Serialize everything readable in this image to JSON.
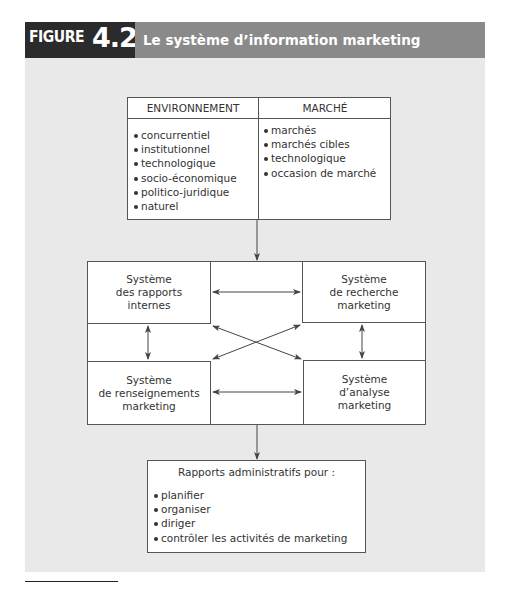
{
  "figure": {
    "label_word": "FIGURE",
    "label_number": "4.2",
    "title": "Le système d’information marketing",
    "colors": {
      "label_bg": "#2b2b2b",
      "title_bg": "#8a8a8a",
      "panel_bg": "#e9e9e9",
      "box_border": "#555555"
    }
  },
  "inputs_table": {
    "columns": [
      {
        "header": "ENVIRONNEMENT",
        "items": [
          "concurrentiel",
          "institutionnel",
          "technologique",
          "socio-économique",
          "politico-juridique",
          "naturel"
        ]
      },
      {
        "header": "MARCHÉ",
        "items": [
          "marchés",
          "marchés cibles",
          "technologique",
          "occasion de marché"
        ]
      }
    ]
  },
  "systems": {
    "top_left": "Système\ndes rapports\ninternes",
    "top_right": "Système\nde recherche\nmarketing",
    "bottom_left": "Système\nde renseignements\nmarketing",
    "bottom_right": "Système\nd’analyse\nmarketing"
  },
  "output": {
    "title": "Rapports administratifs pour :",
    "items": [
      "planifier",
      "organiser",
      "diriger",
      "contrôler les activités de marketing"
    ]
  },
  "connections": [
    {
      "from": "inputs_table",
      "to": "systems",
      "type": "one-way"
    },
    {
      "from": "top_left",
      "to": "top_right",
      "type": "two-way"
    },
    {
      "from": "top_left",
      "to": "bottom_left",
      "type": "two-way"
    },
    {
      "from": "top_right",
      "to": "bottom_right",
      "type": "two-way"
    },
    {
      "from": "bottom_left",
      "to": "bottom_right",
      "type": "two-way"
    },
    {
      "from": "top_left",
      "to": "bottom_right",
      "type": "two-way"
    },
    {
      "from": "top_right",
      "to": "bottom_left",
      "type": "two-way"
    },
    {
      "from": "systems",
      "to": "output",
      "type": "one-way"
    }
  ]
}
